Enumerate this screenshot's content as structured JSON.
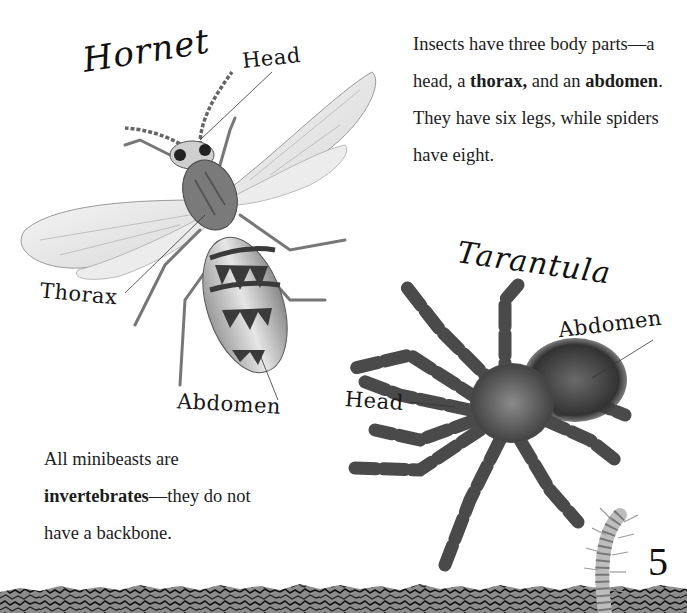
{
  "page": {
    "page_number": "5",
    "background_color": "#ffffff",
    "ink_color": "#1a1a1a"
  },
  "intro_text": {
    "parts": [
      {
        "text": "Insects have three body parts—a head, a ",
        "bold": false
      },
      {
        "text": "thorax,",
        "bold": true
      },
      {
        "text": " and an ",
        "bold": false
      },
      {
        "text": "abdomen",
        "bold": true
      },
      {
        "text": ". They have six legs, while spiders have eight.",
        "bold": false
      }
    ]
  },
  "note_text": {
    "parts": [
      {
        "text": "All minibeasts are ",
        "bold": false
      },
      {
        "text": "invertebrates",
        "bold": true
      },
      {
        "text": "—they do not have a backbone.",
        "bold": false
      }
    ]
  },
  "hornet": {
    "title": "Hornet",
    "labels": {
      "head": "Head",
      "thorax": "Thorax",
      "abdomen": "Abdomen"
    }
  },
  "tarantula": {
    "title": "Tarantula",
    "labels": {
      "head": "Head",
      "abdomen": "Abdomen"
    }
  },
  "decorations": {
    "icons": [
      "hornet-illustration",
      "tarantula-illustration",
      "centipede-illustration",
      "soil-border"
    ]
  }
}
